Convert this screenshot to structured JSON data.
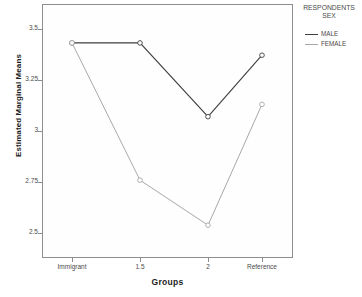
{
  "chart_data": {
    "type": "line",
    "title": "",
    "xlabel": "Groups",
    "ylabel": "Estimated Marginal Means",
    "categories": [
      "Immigrant",
      "1.5",
      "2",
      "Reference"
    ],
    "series": [
      {
        "name": "MALE",
        "values": [
          3.43,
          3.43,
          3.07,
          3.37
        ],
        "color": "#3f3f3f"
      },
      {
        "name": "FEMALE",
        "values": [
          3.43,
          2.76,
          2.54,
          3.13
        ],
        "color": "#a8a8a8"
      }
    ],
    "ylim": [
      2.38,
      3.62
    ],
    "yticks": [
      3.5,
      3.25,
      3,
      2.75,
      2.5
    ],
    "ytick_labels": [
      "3.5",
      "3.25",
      "3",
      "2.75",
      "2.5"
    ],
    "grid": false,
    "marker": "open-circle",
    "legend_position": "right"
  },
  "legend": {
    "title": "RESPONDENTS\nSEX",
    "entries": [
      {
        "label": "MALE"
      },
      {
        "label": "FEMALE"
      }
    ]
  },
  "axes": {
    "x_title": "Groups",
    "y_title": "Estimated Marginal Means"
  }
}
